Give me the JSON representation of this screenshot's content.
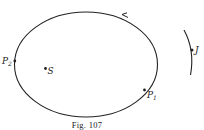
{
  "figure": {
    "caption": "Fig. 107",
    "labels": {
      "p2": "P",
      "p2_sub": "2",
      "s": "S",
      "p1": "P",
      "p1_sub": "1",
      "j": "J"
    },
    "colors": {
      "line": "#222222",
      "background": "#ffffff"
    }
  }
}
